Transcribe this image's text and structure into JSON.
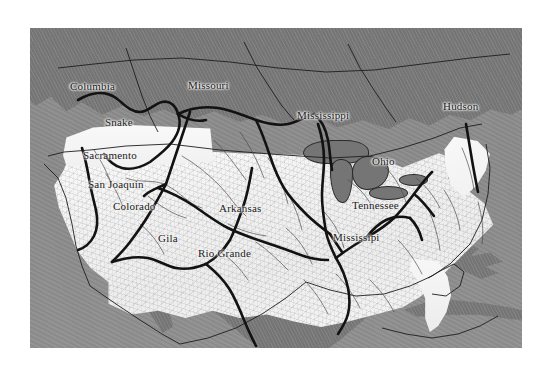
{
  "figure": {
    "kind": "relief-map",
    "region": "North America",
    "highlight_region": "contiguous United States",
    "background_color": "#ffffff",
    "ocean_color": "#8d8d8d",
    "outside_land_color": "#7b7b7b",
    "highlight_land_color": "#f4f4f4",
    "river_line_color": "#121212",
    "label_text_color": "#1a1a1a",
    "frame": {
      "left": 30,
      "top": 28,
      "width": 492,
      "height": 320
    }
  },
  "river_labels": [
    {
      "id": "columbia",
      "text": "Columbia",
      "x": 70,
      "y": 88,
      "on_water": false
    },
    {
      "id": "missouri",
      "text": "Missouri",
      "x": 188,
      "y": 87,
      "on_water": false
    },
    {
      "id": "mississippi-upper",
      "text": "Mississippi",
      "x": 297,
      "y": 117,
      "on_water": false
    },
    {
      "id": "hudson",
      "text": "Hudson",
      "x": 443,
      "y": 108,
      "on_water": false
    },
    {
      "id": "snake",
      "text": "Snake",
      "x": 105,
      "y": 124,
      "on_water": false
    },
    {
      "id": "sacramento",
      "text": "Sacramento",
      "x": 83,
      "y": 157,
      "on_water": false
    },
    {
      "id": "ohio",
      "text": "Ohio",
      "x": 372,
      "y": 163,
      "on_water": false
    },
    {
      "id": "san-joaquin",
      "text": "San Joaquin",
      "x": 88,
      "y": 186,
      "on_water": false
    },
    {
      "id": "colorado",
      "text": "Colorado",
      "x": 113,
      "y": 208,
      "on_water": false
    },
    {
      "id": "arkansas",
      "text": "Arkansas",
      "x": 219,
      "y": 210,
      "on_water": false
    },
    {
      "id": "tennessee",
      "text": "Tennessee",
      "x": 352,
      "y": 207,
      "on_water": false
    },
    {
      "id": "gila",
      "text": "Gila",
      "x": 158,
      "y": 240,
      "on_water": false
    },
    {
      "id": "mississipi-lower",
      "text": "Mississipi",
      "x": 333,
      "y": 239,
      "on_water": false
    },
    {
      "id": "rio-grande",
      "text": "Rio Grande",
      "x": 198,
      "y": 255,
      "on_water": false
    }
  ],
  "rivers": [
    {
      "name": "Columbia"
    },
    {
      "name": "Snake"
    },
    {
      "name": "Sacramento"
    },
    {
      "name": "San Joaquin"
    },
    {
      "name": "Colorado"
    },
    {
      "name": "Gila"
    },
    {
      "name": "Rio Grande"
    },
    {
      "name": "Missouri"
    },
    {
      "name": "Mississippi"
    },
    {
      "name": "Arkansas"
    },
    {
      "name": "Ohio"
    },
    {
      "name": "Tennessee"
    },
    {
      "name": "Hudson"
    }
  ]
}
